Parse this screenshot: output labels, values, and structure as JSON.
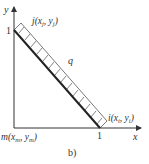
{
  "figure": {
    "caption": "b)",
    "axes": {
      "x_label": "x",
      "y_label": "y",
      "x_tick": "1",
      "y_tick": "1"
    },
    "nodes": {
      "j": {
        "name": "j",
        "x_var": "x",
        "x_sub": "j",
        "y_var": "y",
        "y_sub": "j"
      },
      "i": {
        "name": "i",
        "x_var": "x",
        "x_sub": "i",
        "y_var": "y",
        "y_sub": "i"
      },
      "m": {
        "name": "m",
        "x_var": "x",
        "x_sub": "m",
        "y_var": "y",
        "y_sub": "m"
      }
    },
    "load_label": "q",
    "colors": {
      "line": "#222222",
      "hatch": "#555555",
      "text": "#333333"
    }
  }
}
